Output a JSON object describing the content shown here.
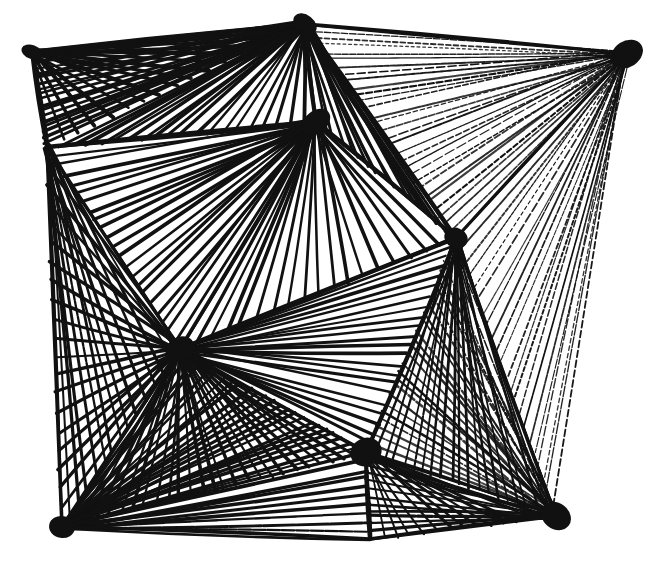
{
  "artwork": {
    "title": "Abstract geometric pen-and-ink line drawing",
    "medium": "pen-and-ink",
    "style": "hatched-fan-polyhedral-network",
    "canvas": {
      "width": 658,
      "height": 568
    },
    "colors": {
      "background": "#ffffff",
      "ink": "#111111"
    },
    "nodes": [
      {
        "id": "top-left-corner",
        "x": 32,
        "y": 52,
        "weight": "heavy"
      },
      {
        "id": "top-apex",
        "x": 305,
        "y": 24,
        "weight": "heavy"
      },
      {
        "id": "top-right-corner",
        "x": 627,
        "y": 54,
        "weight": "heavy"
      },
      {
        "id": "upper-hub",
        "x": 316,
        "y": 122,
        "weight": "heavy"
      },
      {
        "id": "left-mid",
        "x": 47,
        "y": 147,
        "weight": "medium"
      },
      {
        "id": "right-mid",
        "x": 456,
        "y": 238,
        "weight": "heavy"
      },
      {
        "id": "inner-left-apex",
        "x": 180,
        "y": 349,
        "weight": "heavy"
      },
      {
        "id": "lower-center-hub",
        "x": 366,
        "y": 452,
        "weight": "heavy"
      },
      {
        "id": "bottom-left-corner",
        "x": 62,
        "y": 527,
        "weight": "heavy"
      },
      {
        "id": "bottom-mid",
        "x": 370,
        "y": 539,
        "weight": "medium"
      },
      {
        "id": "bottom-right-corner",
        "x": 556,
        "y": 516,
        "weight": "heavy"
      }
    ],
    "edges": [
      {
        "from": "top-left-corner",
        "to": "top-apex",
        "width": 4.0
      },
      {
        "from": "top-apex",
        "to": "top-right-corner",
        "width": 3.4
      },
      {
        "from": "top-left-corner",
        "to": "left-mid",
        "width": 4.0
      },
      {
        "from": "left-mid",
        "to": "upper-hub",
        "width": 4.4
      },
      {
        "from": "top-apex",
        "to": "upper-hub",
        "width": 4.2
      },
      {
        "from": "upper-hub",
        "to": "right-mid",
        "width": 4.2
      },
      {
        "from": "top-apex",
        "to": "right-mid",
        "width": 4.4
      },
      {
        "from": "top-right-corner",
        "to": "right-mid",
        "width": 3.2
      },
      {
        "from": "left-mid",
        "to": "inner-left-apex",
        "width": 3.4
      },
      {
        "from": "left-mid",
        "to": "bottom-left-corner",
        "width": 3.6
      },
      {
        "from": "inner-left-apex",
        "to": "upper-hub",
        "width": 3.6
      },
      {
        "from": "inner-left-apex",
        "to": "right-mid",
        "width": 4.4
      },
      {
        "from": "inner-left-apex",
        "to": "bottom-left-corner",
        "width": 3.8
      },
      {
        "from": "inner-left-apex",
        "to": "lower-center-hub",
        "width": 3.8
      },
      {
        "from": "right-mid",
        "to": "lower-center-hub",
        "width": 4.0
      },
      {
        "from": "right-mid",
        "to": "bottom-right-corner",
        "width": 3.4
      },
      {
        "from": "bottom-left-corner",
        "to": "bottom-mid",
        "width": 3.6
      },
      {
        "from": "lower-center-hub",
        "to": "bottom-mid",
        "width": 4.2
      },
      {
        "from": "bottom-mid",
        "to": "bottom-right-corner",
        "width": 3.4
      },
      {
        "from": "lower-center-hub",
        "to": "bottom-right-corner",
        "width": 3.2
      },
      {
        "from": "bottom-left-corner",
        "to": "lower-center-hub",
        "width": 3.0
      }
    ],
    "fans": [
      {
        "id": "fan-top-left-down",
        "apex": "top-left-corner",
        "a": "top-apex",
        "b": "left-mid",
        "count": 16,
        "width": 3.2,
        "density": "dense"
      },
      {
        "id": "fan-top-apex-left",
        "apex": "top-apex",
        "a": "top-left-corner",
        "b": "left-mid",
        "count": 18,
        "width": 3.0,
        "density": "dense"
      },
      {
        "id": "fan-top-apex-hub",
        "apex": "top-apex",
        "a": "left-mid",
        "b": "upper-hub",
        "count": 20,
        "width": 3.0,
        "density": "dense"
      },
      {
        "id": "fan-top-apex-right",
        "apex": "top-apex",
        "a": "upper-hub",
        "b": "right-mid",
        "count": 16,
        "width": 2.6,
        "density": "medium"
      },
      {
        "id": "fan-top-right-in",
        "apex": "top-right-corner",
        "a": "top-apex",
        "b": "right-mid",
        "count": 30,
        "width": 1.7,
        "density": "sparse"
      },
      {
        "id": "fan-top-right-low",
        "apex": "top-right-corner",
        "a": "right-mid",
        "b": "bottom-right-corner",
        "count": 22,
        "width": 1.5,
        "density": "sparse"
      },
      {
        "id": "fan-hub-left",
        "apex": "upper-hub",
        "a": "left-mid",
        "b": "inner-left-apex",
        "count": 22,
        "width": 3.0,
        "density": "dense"
      },
      {
        "id": "fan-hub-right",
        "apex": "upper-hub",
        "a": "inner-left-apex",
        "b": "right-mid",
        "count": 18,
        "width": 3.0,
        "density": "dense"
      },
      {
        "id": "fan-left-mid-down",
        "apex": "left-mid",
        "a": "inner-left-apex",
        "b": "bottom-left-corner",
        "count": 14,
        "width": 2.6,
        "density": "medium"
      },
      {
        "id": "fan-inner-apex-left",
        "apex": "inner-left-apex",
        "a": "left-mid",
        "b": "bottom-left-corner",
        "count": 20,
        "width": 2.8,
        "density": "dense"
      },
      {
        "id": "fan-inner-apex-down",
        "apex": "inner-left-apex",
        "a": "bottom-left-corner",
        "b": "lower-center-hub",
        "count": 26,
        "width": 2.8,
        "density": "dense"
      },
      {
        "id": "fan-inner-apex-right",
        "apex": "inner-left-apex",
        "a": "lower-center-hub",
        "b": "right-mid",
        "count": 22,
        "width": 2.8,
        "density": "dense"
      },
      {
        "id": "fan-right-mid-down",
        "apex": "right-mid",
        "a": "lower-center-hub",
        "b": "bottom-right-corner",
        "count": 20,
        "width": 2.2,
        "density": "medium"
      },
      {
        "id": "fan-bl-corner-up",
        "apex": "bottom-left-corner",
        "a": "inner-left-apex",
        "b": "lower-center-hub",
        "count": 24,
        "width": 2.8,
        "density": "dense"
      },
      {
        "id": "fan-bl-corner-bottom",
        "apex": "bottom-left-corner",
        "a": "lower-center-hub",
        "b": "bottom-mid",
        "count": 10,
        "width": 2.8,
        "density": "medium"
      },
      {
        "id": "fan-lower-hub-bottom",
        "apex": "lower-center-hub",
        "a": "bottom-mid",
        "b": "bottom-right-corner",
        "count": 14,
        "width": 2.4,
        "density": "medium"
      },
      {
        "id": "fan-br-corner-up",
        "apex": "bottom-right-corner",
        "a": "right-mid",
        "b": "lower-center-hub",
        "count": 26,
        "width": 2.0,
        "density": "sparse"
      },
      {
        "id": "fan-br-corner-left",
        "apex": "bottom-right-corner",
        "a": "lower-center-hub",
        "b": "bottom-mid",
        "count": 12,
        "width": 2.6,
        "density": "medium"
      }
    ],
    "blobs": [
      {
        "at": "top-apex",
        "rx": 13,
        "ry": 9
      },
      {
        "at": "upper-hub",
        "rx": 16,
        "ry": 11
      },
      {
        "at": "top-right-corner",
        "rx": 17,
        "ry": 13
      },
      {
        "at": "top-left-corner",
        "rx": 11,
        "ry": 7
      },
      {
        "at": "right-mid",
        "rx": 12,
        "ry": 10
      },
      {
        "at": "inner-left-apex",
        "rx": 15,
        "ry": 12
      },
      {
        "at": "lower-center-hub",
        "rx": 16,
        "ry": 14
      },
      {
        "at": "bottom-left-corner",
        "rx": 13,
        "ry": 11
      },
      {
        "at": "bottom-right-corner",
        "rx": 16,
        "ry": 13
      }
    ]
  }
}
